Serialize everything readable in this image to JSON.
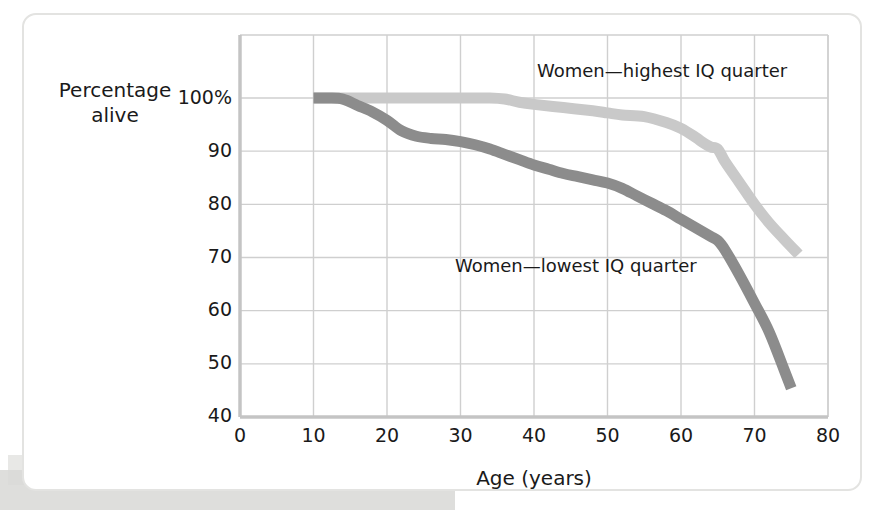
{
  "figure": {
    "background_color": "#ffffff",
    "card_border_color": "#e3e3e1"
  },
  "chart_data": {
    "type": "line",
    "title": "",
    "xlabel": "Age (years)",
    "ylabel_line1": "Percentage",
    "ylabel_line2": "alive",
    "xlim": [
      0,
      80
    ],
    "ylim": [
      40,
      102
    ],
    "xticks": [
      0,
      10,
      20,
      30,
      40,
      50,
      60,
      70,
      80
    ],
    "xticklabels": [
      "0",
      "10",
      "20",
      "30",
      "40",
      "50",
      "60",
      "70",
      "80"
    ],
    "yticks": [
      100,
      90,
      80,
      70,
      60,
      50,
      40
    ],
    "yticklabels": [
      "100%",
      "90",
      "80",
      "70",
      "60",
      "50",
      "40"
    ],
    "grid": true,
    "grid_color": "#cfcfcf",
    "legend_position": "inline-annotations",
    "series": [
      {
        "name": "Women—highest IQ quarter",
        "color": "#c9c9c9",
        "linewidth": 11,
        "label_x": 537,
        "label_y": 60,
        "x": [
          10,
          14,
          18,
          22,
          26,
          30,
          34,
          36,
          38,
          40,
          44,
          48,
          50,
          52,
          55,
          58,
          60,
          62,
          63,
          64,
          65,
          66,
          68,
          70,
          72,
          74,
          76
        ],
        "y": [
          100,
          100,
          100,
          100,
          100,
          100,
          100,
          99.8,
          99.2,
          98.8,
          98.2,
          97.6,
          97.2,
          96.8,
          96.5,
          95.4,
          94.3,
          92.6,
          91.6,
          90.8,
          90.4,
          88.0,
          84.0,
          80.0,
          76.5,
          73.5,
          70.6
        ]
      },
      {
        "name": "Women—lowest IQ quarter",
        "color": "#8c8c8c",
        "linewidth": 11,
        "label_x": 455,
        "label_y": 255,
        "x": [
          10,
          12,
          14,
          16,
          18,
          20,
          22,
          24,
          26,
          28,
          30,
          32,
          34,
          36,
          38,
          40,
          42,
          44,
          46,
          48,
          50,
          52,
          54,
          56,
          58,
          60,
          62,
          64,
          65,
          66,
          68,
          70,
          72,
          74,
          75
        ],
        "y": [
          100,
          100,
          99.8,
          98.6,
          97.4,
          95.8,
          93.8,
          92.8,
          92.4,
          92.2,
          91.8,
          91.2,
          90.4,
          89.4,
          88.4,
          87.4,
          86.6,
          85.8,
          85.2,
          84.6,
          84.0,
          83.0,
          81.6,
          80.2,
          78.8,
          77.2,
          75.6,
          74.0,
          73.2,
          71.4,
          66.6,
          61.4,
          56.0,
          49.0,
          45.4
        ]
      }
    ]
  }
}
